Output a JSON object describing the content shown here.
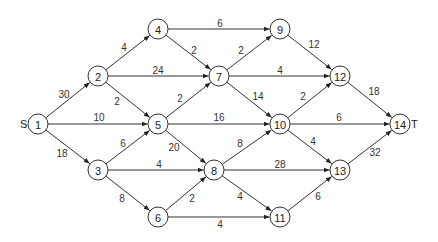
{
  "diagram": {
    "type": "directed-network",
    "source_label": "S",
    "sink_label": "T",
    "nodes": [
      {
        "id": "1",
        "x": 38,
        "y": 124
      },
      {
        "id": "2",
        "x": 98,
        "y": 76
      },
      {
        "id": "3",
        "x": 98,
        "y": 170
      },
      {
        "id": "4",
        "x": 158,
        "y": 29
      },
      {
        "id": "5",
        "x": 158,
        "y": 124
      },
      {
        "id": "6",
        "x": 158,
        "y": 217
      },
      {
        "id": "7",
        "x": 219,
        "y": 76
      },
      {
        "id": "8",
        "x": 214,
        "y": 170
      },
      {
        "id": "9",
        "x": 280,
        "y": 29
      },
      {
        "id": "10",
        "x": 280,
        "y": 124
      },
      {
        "id": "11",
        "x": 280,
        "y": 217
      },
      {
        "id": "12",
        "x": 340,
        "y": 76
      },
      {
        "id": "13",
        "x": 340,
        "y": 170
      },
      {
        "id": "14",
        "x": 400,
        "y": 124
      }
    ],
    "edges": [
      {
        "from": "1",
        "to": "2",
        "weight": "30",
        "lx": 64,
        "ly": 94
      },
      {
        "from": "1",
        "to": "5",
        "weight": "10",
        "lx": 99,
        "ly": 117
      },
      {
        "from": "1",
        "to": "3",
        "weight": "18",
        "lx": 62,
        "ly": 153
      },
      {
        "from": "2",
        "to": "4",
        "weight": "4",
        "lx": 124,
        "ly": 47
      },
      {
        "from": "2",
        "to": "7",
        "weight": "24",
        "lx": 158,
        "ly": 70
      },
      {
        "from": "2",
        "to": "5",
        "weight": "2",
        "lx": 117,
        "ly": 101
      },
      {
        "from": "3",
        "to": "5",
        "weight": "6",
        "lx": 123,
        "ly": 143
      },
      {
        "from": "3",
        "to": "8",
        "weight": "4",
        "lx": 159,
        "ly": 164
      },
      {
        "from": "3",
        "to": "6",
        "weight": "8",
        "lx": 122,
        "ly": 198
      },
      {
        "from": "4",
        "to": "9",
        "weight": "6",
        "lx": 220,
        "ly": 23
      },
      {
        "from": "4",
        "to": "7",
        "weight": "2",
        "lx": 194,
        "ly": 50
      },
      {
        "from": "5",
        "to": "7",
        "weight": "2",
        "lx": 180,
        "ly": 98
      },
      {
        "from": "5",
        "to": "10",
        "weight": "16",
        "lx": 219,
        "ly": 117
      },
      {
        "from": "5",
        "to": "8",
        "weight": "20",
        "lx": 174,
        "ly": 147
      },
      {
        "from": "6",
        "to": "8",
        "weight": "2",
        "lx": 192,
        "ly": 198
      },
      {
        "from": "6",
        "to": "11",
        "weight": "4",
        "lx": 220,
        "ly": 224
      },
      {
        "from": "7",
        "to": "9",
        "weight": "2",
        "lx": 241,
        "ly": 50
      },
      {
        "from": "7",
        "to": "12",
        "weight": "4",
        "lx": 280,
        "ly": 70
      },
      {
        "from": "7",
        "to": "10",
        "weight": "14",
        "lx": 258,
        "ly": 96
      },
      {
        "from": "8",
        "to": "10",
        "weight": "8",
        "lx": 240,
        "ly": 143
      },
      {
        "from": "8",
        "to": "13",
        "weight": "28",
        "lx": 280,
        "ly": 164
      },
      {
        "from": "8",
        "to": "11",
        "weight": "4",
        "lx": 240,
        "ly": 196
      },
      {
        "from": "9",
        "to": "12",
        "weight": "12",
        "lx": 314,
        "ly": 44
      },
      {
        "from": "10",
        "to": "12",
        "weight": "2",
        "lx": 303,
        "ly": 96
      },
      {
        "from": "10",
        "to": "14",
        "weight": "6",
        "lx": 339,
        "ly": 117
      },
      {
        "from": "10",
        "to": "13",
        "weight": "4",
        "lx": 313,
        "ly": 141
      },
      {
        "from": "11",
        "to": "13",
        "weight": "6",
        "lx": 318,
        "ly": 196
      },
      {
        "from": "12",
        "to": "14",
        "weight": "18",
        "lx": 374,
        "ly": 91
      },
      {
        "from": "13",
        "to": "14",
        "weight": "32",
        "lx": 375,
        "ly": 152
      }
    ]
  }
}
